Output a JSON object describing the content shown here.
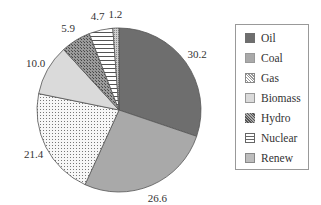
{
  "chart_data": {
    "type": "pie",
    "title": "",
    "categories": [
      "Oil",
      "Coal",
      "Gas",
      "Biomass",
      "Hydro",
      "Nuclear",
      "Renew"
    ],
    "values": [
      30.2,
      26.6,
      21.4,
      10.0,
      5.9,
      4.7,
      1.2
    ],
    "value_labels": [
      "30.2",
      "26.6",
      "21.4",
      "10.0",
      "5.9",
      "4.7",
      "1.2"
    ],
    "colors": [
      "#6e6e6e",
      "#a9a9a9",
      "#f0f0f0",
      "#dadada",
      "#8a8a8a",
      "#ffffff",
      "#bdbdbd"
    ],
    "patterns": [
      "solid",
      "solid",
      "dots",
      "solid",
      "crosshatch",
      "horizontal-lines",
      "fine-dots"
    ],
    "start_angle": "12 o'clock, clockwise",
    "legend_position": "right"
  },
  "legend": {
    "items": [
      "Oil",
      "Coal",
      "Gas",
      "Biomass",
      "Hydro",
      "Nuclear",
      "Renew"
    ]
  }
}
